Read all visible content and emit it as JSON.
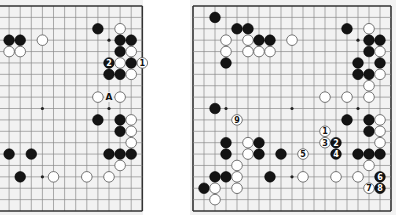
{
  "colors": {
    "board": "#f2f2f2",
    "grid": "#8a8a8a",
    "black": "#141414",
    "white": "#ffffff"
  },
  "diagrams": [
    {
      "id": "left-diagram",
      "x0": -57.5,
      "y0": 6,
      "dx": 11.1,
      "dy": 11.39,
      "clip": {
        "x": 0,
        "y": 0,
        "w": 143,
        "h": 213
      },
      "cols_visible": [
        6,
        18
      ],
      "edges": {
        "top": true,
        "bottom": true,
        "right": true,
        "left": false
      },
      "hoshi": [
        [
          9,
          3
        ],
        [
          15,
          3
        ],
        [
          9,
          9
        ],
        [
          15,
          9
        ],
        [
          9,
          15
        ],
        [
          15,
          15
        ]
      ],
      "stones": [
        {
          "c": "b",
          "x": 14,
          "y": 2
        },
        {
          "c": "w",
          "x": 16,
          "y": 2
        },
        {
          "c": "b",
          "x": 6,
          "y": 3
        },
        {
          "c": "b",
          "x": 7,
          "y": 3
        },
        {
          "c": "w",
          "x": 9,
          "y": 3
        },
        {
          "c": "b",
          "x": 16,
          "y": 3
        },
        {
          "c": "b",
          "x": 17,
          "y": 3
        },
        {
          "c": "w",
          "x": 6,
          "y": 4
        },
        {
          "c": "w",
          "x": 7,
          "y": 4
        },
        {
          "c": "b",
          "x": 16,
          "y": 4
        },
        {
          "c": "w",
          "x": 17,
          "y": 4
        },
        {
          "c": "b",
          "x": 15,
          "y": 5,
          "label": "2"
        },
        {
          "c": "w",
          "x": 16,
          "y": 5
        },
        {
          "c": "b",
          "x": 17,
          "y": 5
        },
        {
          "c": "w",
          "x": 18,
          "y": 5,
          "label": "1"
        },
        {
          "c": "b",
          "x": 15,
          "y": 6
        },
        {
          "c": "b",
          "x": 16,
          "y": 6
        },
        {
          "c": "w",
          "x": 17,
          "y": 6
        },
        {
          "c": "w",
          "x": 14,
          "y": 8
        },
        {
          "c": "w",
          "x": 16,
          "y": 8
        },
        {
          "c": "b",
          "x": 14,
          "y": 10
        },
        {
          "c": "b",
          "x": 16,
          "y": 10
        },
        {
          "c": "w",
          "x": 17,
          "y": 10
        },
        {
          "c": "b",
          "x": 16,
          "y": 11
        },
        {
          "c": "w",
          "x": 17,
          "y": 11
        },
        {
          "c": "w",
          "x": 17,
          "y": 12
        },
        {
          "c": "b",
          "x": 6,
          "y": 13
        },
        {
          "c": "b",
          "x": 8,
          "y": 13
        },
        {
          "c": "b",
          "x": 15,
          "y": 13
        },
        {
          "c": "b",
          "x": 16,
          "y": 13
        },
        {
          "c": "b",
          "x": 17,
          "y": 13
        },
        {
          "c": "w",
          "x": 16,
          "y": 14
        },
        {
          "c": "b",
          "x": 7,
          "y": 15
        },
        {
          "c": "w",
          "x": 10,
          "y": 15
        },
        {
          "c": "w",
          "x": 13,
          "y": 15
        },
        {
          "c": "w",
          "x": 15,
          "y": 15
        }
      ],
      "marks": [
        {
          "x": 15,
          "y": 8,
          "label": "A"
        }
      ]
    },
    {
      "id": "right-diagram",
      "x0": 193,
      "y0": 6,
      "dx": 11.0,
      "dy": 11.39,
      "clip": {
        "x": 190,
        "y": 0,
        "w": 206,
        "h": 213
      },
      "cols_visible": [
        0,
        18
      ],
      "edges": {
        "top": true,
        "bottom": true,
        "right": true,
        "left": true
      },
      "hoshi": [
        [
          3,
          3
        ],
        [
          9,
          3
        ],
        [
          15,
          3
        ],
        [
          3,
          9
        ],
        [
          9,
          9
        ],
        [
          15,
          9
        ],
        [
          3,
          15
        ],
        [
          9,
          15
        ],
        [
          15,
          15
        ]
      ],
      "stones": [
        {
          "c": "b",
          "x": 2,
          "y": 1
        },
        {
          "c": "b",
          "x": 4,
          "y": 2
        },
        {
          "c": "b",
          "x": 5,
          "y": 2
        },
        {
          "c": "b",
          "x": 14,
          "y": 2
        },
        {
          "c": "w",
          "x": 16,
          "y": 2
        },
        {
          "c": "w",
          "x": 3,
          "y": 3
        },
        {
          "c": "w",
          "x": 5,
          "y": 3
        },
        {
          "c": "b",
          "x": 6,
          "y": 3
        },
        {
          "c": "b",
          "x": 7,
          "y": 3
        },
        {
          "c": "w",
          "x": 9,
          "y": 3
        },
        {
          "c": "b",
          "x": 16,
          "y": 3
        },
        {
          "c": "b",
          "x": 17,
          "y": 3
        },
        {
          "c": "w",
          "x": 3,
          "y": 4
        },
        {
          "c": "w",
          "x": 5,
          "y": 4
        },
        {
          "c": "w",
          "x": 6,
          "y": 4
        },
        {
          "c": "w",
          "x": 7,
          "y": 4
        },
        {
          "c": "b",
          "x": 16,
          "y": 4
        },
        {
          "c": "w",
          "x": 17,
          "y": 4
        },
        {
          "c": "b",
          "x": 3,
          "y": 5
        },
        {
          "c": "b",
          "x": 15,
          "y": 5
        },
        {
          "c": "b",
          "x": 17,
          "y": 5
        },
        {
          "c": "b",
          "x": 15,
          "y": 6
        },
        {
          "c": "b",
          "x": 16,
          "y": 6
        },
        {
          "c": "w",
          "x": 17,
          "y": 6
        },
        {
          "c": "w",
          "x": 16,
          "y": 7
        },
        {
          "c": "w",
          "x": 12,
          "y": 8
        },
        {
          "c": "w",
          "x": 14,
          "y": 8
        },
        {
          "c": "w",
          "x": 16,
          "y": 8
        },
        {
          "c": "b",
          "x": 2,
          "y": 9
        },
        {
          "c": "w",
          "x": 4,
          "y": 10,
          "label": "9"
        },
        {
          "c": "b",
          "x": 14,
          "y": 10
        },
        {
          "c": "b",
          "x": 16,
          "y": 10
        },
        {
          "c": "w",
          "x": 17,
          "y": 10
        },
        {
          "c": "w",
          "x": 12,
          "y": 11,
          "label": "1"
        },
        {
          "c": "b",
          "x": 16,
          "y": 11
        },
        {
          "c": "w",
          "x": 17,
          "y": 11
        },
        {
          "c": "b",
          "x": 3,
          "y": 12
        },
        {
          "c": "w",
          "x": 5,
          "y": 12
        },
        {
          "c": "b",
          "x": 6,
          "y": 12
        },
        {
          "c": "w",
          "x": 12,
          "y": 12,
          "label": "3"
        },
        {
          "c": "b",
          "x": 13,
          "y": 12,
          "label": "2"
        },
        {
          "c": "w",
          "x": 17,
          "y": 12
        },
        {
          "c": "b",
          "x": 3,
          "y": 13
        },
        {
          "c": "w",
          "x": 5,
          "y": 13
        },
        {
          "c": "b",
          "x": 6,
          "y": 13
        },
        {
          "c": "b",
          "x": 8,
          "y": 13
        },
        {
          "c": "w",
          "x": 10,
          "y": 13,
          "label": "5"
        },
        {
          "c": "b",
          "x": 13,
          "y": 13,
          "label": "4"
        },
        {
          "c": "b",
          "x": 15,
          "y": 13
        },
        {
          "c": "b",
          "x": 16,
          "y": 13
        },
        {
          "c": "b",
          "x": 17,
          "y": 13
        },
        {
          "c": "w",
          "x": 4,
          "y": 14
        },
        {
          "c": "w",
          "x": 16,
          "y": 14
        },
        {
          "c": "b",
          "x": 2,
          "y": 15
        },
        {
          "c": "b",
          "x": 3,
          "y": 15
        },
        {
          "c": "w",
          "x": 4,
          "y": 15
        },
        {
          "c": "b",
          "x": 7,
          "y": 15
        },
        {
          "c": "w",
          "x": 10,
          "y": 15
        },
        {
          "c": "w",
          "x": 13,
          "y": 15
        },
        {
          "c": "w",
          "x": 15,
          "y": 15
        },
        {
          "c": "b",
          "x": 17,
          "y": 15,
          "label": "6"
        },
        {
          "c": "b",
          "x": 1,
          "y": 16
        },
        {
          "c": "w",
          "x": 2,
          "y": 16
        },
        {
          "c": "w",
          "x": 4,
          "y": 16
        },
        {
          "c": "w",
          "x": 16,
          "y": 16,
          "label": "7"
        },
        {
          "c": "b",
          "x": 17,
          "y": 16,
          "label": "8"
        },
        {
          "c": "w",
          "x": 2,
          "y": 17
        }
      ],
      "marks": []
    }
  ]
}
